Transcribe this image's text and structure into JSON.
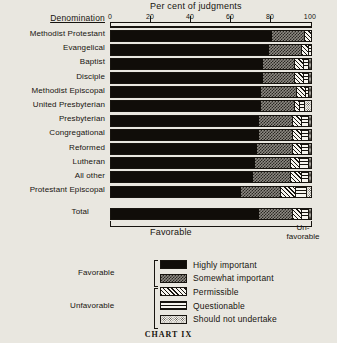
{
  "caption": "CHART IX",
  "header": {
    "denomination_label": "Denomination",
    "axis_title": "Per cent of judgments"
  },
  "footer": {
    "favorable_label": "Favorable",
    "unfavorable_label": "Un-\nfavorable",
    "unfavorable_line1": "Un-",
    "unfavorable_line2": "favorable"
  },
  "legend": {
    "groups": [
      {
        "name": "Favorable",
        "label": "Favorable"
      },
      {
        "name": "Unfavorable",
        "label": "Unfavorable"
      }
    ],
    "items": [
      {
        "key": "highly",
        "label": "Highly important",
        "pattern": "solid-black"
      },
      {
        "key": "somewhat",
        "label": "Somewhat important",
        "pattern": "dense-checker"
      },
      {
        "key": "permissible",
        "label": "Permissible",
        "pattern": "diagonal-hatch"
      },
      {
        "key": "questionable",
        "label": "Questionable",
        "pattern": "horizontal-lines"
      },
      {
        "key": "shouldnot",
        "label": "Should not undertake",
        "pattern": "sparse-dots"
      }
    ]
  },
  "chart_data": {
    "type": "bar",
    "orientation": "horizontal",
    "stacked": true,
    "title": "Per cent of judgments",
    "xlabel": "Per cent of judgments",
    "ylabel": "Denomination",
    "xlim": [
      0,
      100
    ],
    "xticks": [
      0,
      20,
      40,
      60,
      80,
      100
    ],
    "xtick_labels": [
      "0",
      "20",
      "40",
      "60",
      "80",
      "100"
    ],
    "grid": false,
    "legend_position": "bottom",
    "categories": [
      "Methodist Protestant",
      "Evangelical",
      "Baptist",
      "Disciple",
      "Methodist Episcopal",
      "United Presbyterian",
      "Presbyterian",
      "Congregational",
      "Reformed",
      "Lutheran",
      "All other",
      "Protestant Episcopal",
      "Total"
    ],
    "series": [
      {
        "name": "Highly important",
        "values": [
          81,
          80,
          77,
          77,
          76,
          76,
          75,
          75,
          74,
          73,
          72,
          66,
          75
        ]
      },
      {
        "name": "Somewhat important",
        "values": [
          16,
          16,
          16,
          16,
          18,
          17,
          17,
          17,
          18,
          18,
          19,
          20,
          17
        ]
      },
      {
        "name": "Permissible",
        "values": [
          3,
          3,
          4,
          4,
          4,
          2,
          4,
          4,
          4,
          4,
          5,
          7,
          4
        ]
      },
      {
        "name": "Questionable",
        "values": [
          0,
          1,
          2,
          2,
          1,
          2,
          3,
          3,
          3,
          4,
          3,
          5,
          3
        ]
      },
      {
        "name": "Should not undertake",
        "values": [
          0,
          0,
          1,
          1,
          1,
          3,
          1,
          1,
          1,
          1,
          1,
          2,
          1
        ]
      }
    ]
  }
}
